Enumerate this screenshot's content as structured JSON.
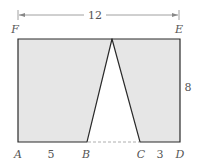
{
  "diagram": {
    "points": {
      "A": "A",
      "B": "B",
      "C": "C",
      "D": "D",
      "E": "E",
      "F": "F"
    },
    "dimensions": {
      "width": "12",
      "height": "8",
      "AB": "5",
      "CD": "3"
    },
    "colors": {
      "fill": "#e6e6e6",
      "stroke": "#2a2a2a",
      "dashed": "#999999",
      "text": "#555555"
    }
  }
}
